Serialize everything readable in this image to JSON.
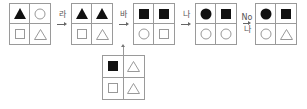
{
  "diagram": {
    "grids": [
      {
        "id": "g1",
        "cells": [
          "triangle-filled",
          "circle-outline",
          "square-outline",
          "triangle-outline"
        ]
      },
      {
        "id": "g2",
        "cells": [
          "triangle-filled",
          "triangle-filled",
          "square-outline",
          "triangle-outline"
        ]
      },
      {
        "id": "g3",
        "cells": [
          "square-filled",
          "square-filled",
          "circle-outline",
          "square-outline"
        ]
      },
      {
        "id": "g4",
        "cells": [
          "circle-filled",
          "square-filled",
          "circle-outline",
          "circle-outline"
        ]
      },
      {
        "id": "g5",
        "cells": [
          "circle-filled",
          "square-filled",
          "circle-outline",
          "triangle-outline"
        ]
      },
      {
        "id": "g6",
        "cells": [
          "square-filled",
          "triangle-outline",
          "square-outline",
          "triangle-outline"
        ]
      }
    ],
    "arrows": [
      {
        "from": "g1",
        "to": "g2",
        "label": "라"
      },
      {
        "from": "g2",
        "to": "g3",
        "label": "바"
      },
      {
        "from": "g3",
        "to": "g4",
        "label": "나"
      },
      {
        "from": "g4",
        "to": "g5",
        "label": "No",
        "label2": "나"
      }
    ],
    "input_arrow": {
      "from": "g6",
      "to": "arrow-g2-g3"
    }
  }
}
